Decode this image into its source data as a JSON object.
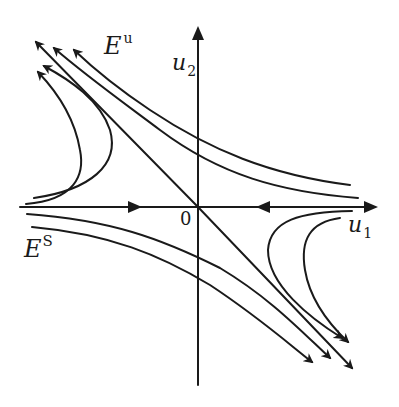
{
  "figure": {
    "labels": {
      "unstable_subspace": {
        "base": "E",
        "superscript": "u"
      },
      "stable_subspace": {
        "base": "E",
        "superscript": "S"
      },
      "x_axis": {
        "base": "u",
        "subscript": "1"
      },
      "y_axis": {
        "base": "u",
        "subscript": "2"
      },
      "origin": "0"
    },
    "colors": {
      "ink": "#1a1a1a",
      "background": "#ffffff"
    }
  }
}
